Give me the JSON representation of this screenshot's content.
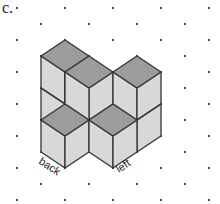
{
  "figure": {
    "part_label": "c.",
    "axis_labels": {
      "back": "back",
      "left": "left"
    },
    "colors": {
      "top_face": "#9a9a9a",
      "side_face": "#d6d6d6",
      "edge": "#333333",
      "dot": "#222222"
    },
    "grid": {
      "type": "isometric-dot",
      "rows_y": [
        8,
        24,
        40,
        56,
        72,
        88,
        104,
        120,
        136,
        152,
        168,
        184,
        200
      ],
      "even_row_x": [
        17,
        65,
        113,
        161,
        209
      ],
      "odd_row_x": [
        41,
        89,
        137,
        185
      ]
    }
  }
}
